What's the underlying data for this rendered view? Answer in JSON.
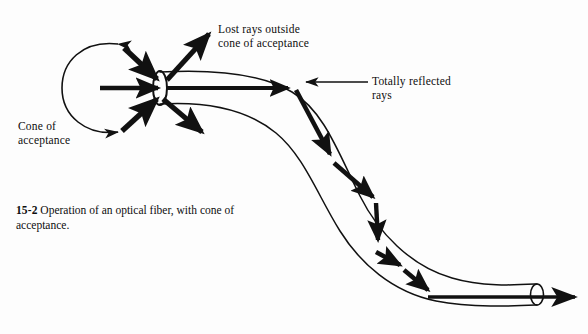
{
  "figure": {
    "background_color": "#fdfdfd",
    "ink_color": "#111111",
    "caption_number": "15-2",
    "caption_text": " Operation of an optical fiber, with cone of acceptance.",
    "labels": {
      "lost_rays": "Lost rays outside\ncone of acceptance",
      "totally_reflected": "Totally reflected\nrays",
      "cone_of_acceptance": "Cone of\nacceptance"
    },
    "elements": {
      "fiber_body": "optical-fiber-s-curve",
      "entrance_face": "entrance-ellipse",
      "exit_face": "exit-ellipse",
      "acceptance_cone_arc": "c-shaped-acceptance-arc",
      "input_rays": 3,
      "lost_rays": 2,
      "bounce_segments": 7,
      "exit_ray": "output-ray-arrow",
      "leader_line": "totally-reflected-leader"
    }
  }
}
